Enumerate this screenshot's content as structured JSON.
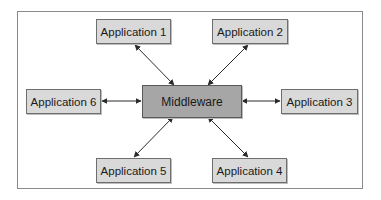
{
  "diagram": {
    "type": "hub-and-spoke",
    "center": {
      "id": "middleware",
      "label": "Middleware",
      "fill": "#a6a6a6"
    },
    "nodes": [
      {
        "id": "app1",
        "label": "Application 1",
        "position": "top-left"
      },
      {
        "id": "app2",
        "label": "Application 2",
        "position": "top-right"
      },
      {
        "id": "app3",
        "label": "Application 3",
        "position": "right"
      },
      {
        "id": "app4",
        "label": "Application 4",
        "position": "bottom-right"
      },
      {
        "id": "app5",
        "label": "Application 5",
        "position": "bottom-left"
      },
      {
        "id": "app6",
        "label": "Application 6",
        "position": "left"
      }
    ],
    "edges": [
      {
        "from": "middleware",
        "to": "app1",
        "direction": "bidirectional"
      },
      {
        "from": "middleware",
        "to": "app2",
        "direction": "bidirectional"
      },
      {
        "from": "middleware",
        "to": "app3",
        "direction": "bidirectional"
      },
      {
        "from": "middleware",
        "to": "app4",
        "direction": "bidirectional"
      },
      {
        "from": "middleware",
        "to": "app5",
        "direction": "bidirectional"
      },
      {
        "from": "middleware",
        "to": "app6",
        "direction": "bidirectional"
      }
    ],
    "colors": {
      "node_fill": "#d9d9d9",
      "center_fill": "#a6a6a6",
      "border": "#6e6e6e",
      "arrow": "#2b2b2b",
      "frame": "#8a8a8a"
    }
  }
}
